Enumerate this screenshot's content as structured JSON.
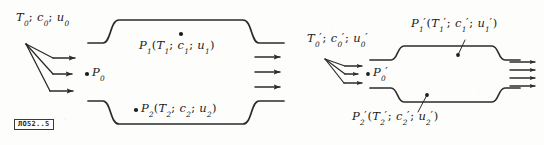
{
  "figure": {
    "caption_plate": "ЛО52..5",
    "stroke_color": "#2b2b2b",
    "background_color": "#fdfdfc"
  },
  "left_diagram": {
    "name": "flow-duct-unprimed",
    "inlet_label": {
      "T": "T",
      "T_sub": "0",
      "c": "c",
      "c_sub": "0",
      "u": "u",
      "u_sub": "0",
      "sep": ";"
    },
    "inlet_point": {
      "P": "P",
      "P_sub": "0"
    },
    "upper_state": {
      "P": "P",
      "P_sub": "1",
      "open": "(",
      "T": "T",
      "T_sub": "1",
      "c": "c",
      "c_sub": "1",
      "u": "u",
      "u_sub": "1",
      "close": ")",
      "sep": ";"
    },
    "lower_state": {
      "P": "P",
      "P_sub": "2",
      "open": "(",
      "T": "T",
      "T_sub": "2",
      "c": "c",
      "c_sub": "2",
      "u": "u",
      "u_sub": "2",
      "close": ")",
      "sep": ";"
    },
    "inlet_arrow_count": 3,
    "outlet_arrow_count": 3
  },
  "right_diagram": {
    "name": "flow-duct-primed",
    "inlet_label": {
      "T": "T",
      "T_sub": "0",
      "T_prime": "′",
      "c": "c",
      "c_sub": "0",
      "c_prime": "′",
      "u": "u",
      "u_sub": "0",
      "u_prime": "′",
      "sep": ";"
    },
    "inlet_point": {
      "P": "P",
      "P_sub": "0",
      "P_prime": "′"
    },
    "upper_state": {
      "P": "P",
      "P_sub": "1",
      "P_prime": "′",
      "open": "(",
      "T": "T",
      "T_sub": "1",
      "T_prime": "′",
      "c": "c",
      "c_sub": "1",
      "c_prime": "′",
      "u": "u",
      "u_sub": "1",
      "u_prime": "′",
      "close": ")",
      "sep": ";"
    },
    "lower_state": {
      "P": "P",
      "P_sub": "2",
      "P_prime": "′",
      "open": "(",
      "T": "T",
      "T_sub": "2",
      "T_prime": "′",
      "c": "c",
      "c_sub": "2",
      "c_prime": "′",
      "u": "u",
      "u_sub": "2",
      "u_prime": "′",
      "close": ")",
      "sep": ";"
    },
    "inlet_arrow_count": 3,
    "outlet_arrow_count": 4
  }
}
